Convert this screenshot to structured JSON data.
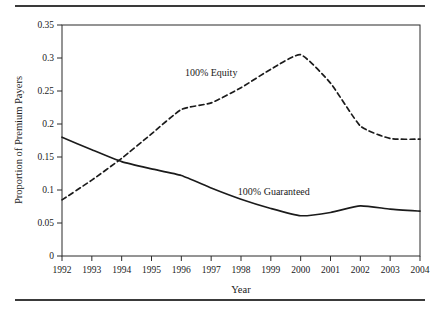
{
  "chart_data": {
    "type": "line",
    "title": "",
    "xlabel": "Year",
    "ylabel": "Proportion of Premium Payers",
    "x": [
      1992,
      1993,
      1994,
      1995,
      1996,
      1997,
      1998,
      1999,
      2000,
      2001,
      2002,
      2003,
      2004
    ],
    "categories": [
      "1992",
      "1993",
      "1994",
      "1995",
      "1996",
      "1997",
      "1998",
      "1999",
      "2000",
      "2001",
      "2002",
      "2003",
      "2004"
    ],
    "xlim": [
      1992,
      2004
    ],
    "ylim": [
      0,
      0.35
    ],
    "yticks": [
      0,
      0.05,
      0.1,
      0.15,
      0.2,
      0.25,
      0.3,
      0.35
    ],
    "ytick_labels": [
      "0",
      "0.05",
      "0.1",
      "0.15",
      "0.2",
      "0.25",
      "0.3",
      "0.35"
    ],
    "grid": false,
    "legend_position": "inline-annotation",
    "series": [
      {
        "name": "100% Equity",
        "style": "dashed",
        "color": "#1b1b1b",
        "values": [
          0.085,
          0.115,
          0.148,
          0.185,
          0.222,
          0.232,
          0.255,
          0.283,
          0.305,
          0.262,
          0.197,
          0.178,
          0.177
        ],
        "annotation": {
          "text": "100% Equity",
          "x": 1997.0,
          "y": 0.272
        }
      },
      {
        "name": "100% Guaranteed",
        "style": "solid",
        "color": "#1b1b1b",
        "values": [
          0.18,
          0.161,
          0.143,
          0.132,
          0.122,
          0.103,
          0.086,
          0.072,
          0.061,
          0.066,
          0.076,
          0.071,
          0.068
        ],
        "annotation": {
          "text": "100% Guaranteed",
          "x": 1999.1,
          "y": 0.092
        }
      }
    ]
  },
  "axis": {
    "y_title": "Proportion of Premium Payers",
    "x_title": "Year"
  }
}
